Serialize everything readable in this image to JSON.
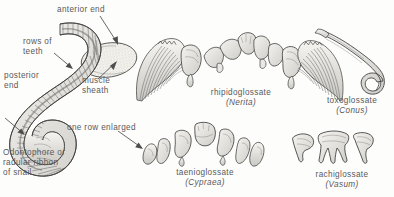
{
  "figure": {
    "background_color": "#fdfdfb",
    "ink_color": "#3c3c3c",
    "text_color": "#59595b",
    "labels": {
      "anterior_end": "anterior  end",
      "rows_of_teeth": "rows  of\nteeth",
      "posterior_end": "posterior\nend",
      "muscle_sheath": "muscle\nsheath",
      "one_row_enlarged": "one  row  enlarged",
      "odontophore": "Odontophore or\nradular ribbon\nof snail"
    },
    "specimens": [
      {
        "id": "rhipidoglossate",
        "type_name": "rhipidoglossate",
        "genus": "(Nerita)"
      },
      {
        "id": "toxoglossate",
        "type_name": "toxoglossate",
        "genus": "(Conus)"
      },
      {
        "id": "taenioglossate",
        "type_name": "taenioglossate",
        "genus": "(Cypraea)"
      },
      {
        "id": "rachiglossate",
        "type_name": "rachiglossate",
        "genus": "(Vasum)"
      }
    ]
  }
}
